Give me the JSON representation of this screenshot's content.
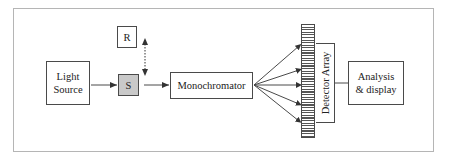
{
  "diagram": {
    "nodes": {
      "light_source": "Light\nSource",
      "reference": "R",
      "sample": "S",
      "monochromator": "Monochromator",
      "detector_array": "Detector Array",
      "analysis": "Analysis\n& display"
    },
    "edges": [
      {
        "from": "light_source",
        "to": "sample",
        "style": "solid-arrow"
      },
      {
        "from": "reference",
        "to": "sample",
        "style": "dotted-double-arrow",
        "meaning": "interchange R/S"
      },
      {
        "from": "sample",
        "to": "monochromator",
        "style": "solid-arrow"
      },
      {
        "from": "monochromator",
        "to": "detector_array",
        "style": "fan-out",
        "count": 5
      },
      {
        "from": "detector_array",
        "to": "analysis",
        "style": "line"
      }
    ],
    "colors": {
      "line": "#4a4a4a",
      "sample_fill": "#c9c9c9",
      "frame": "#b5b5b5"
    }
  }
}
